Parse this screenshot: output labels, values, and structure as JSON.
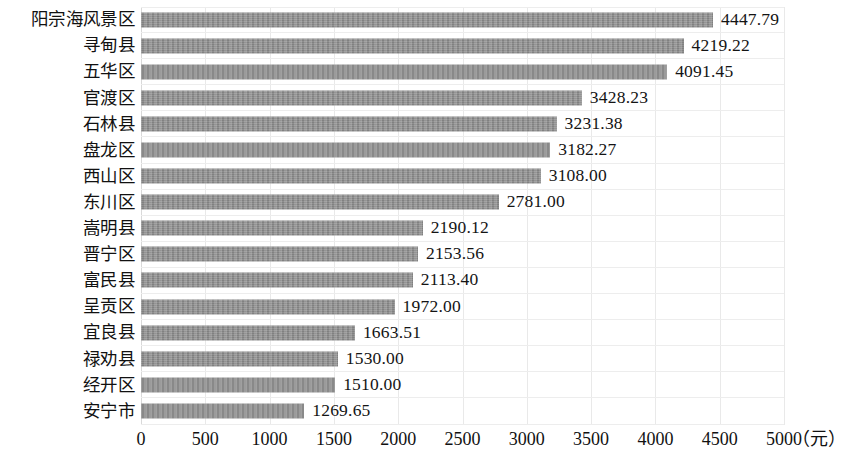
{
  "chart_data": {
    "type": "bar",
    "orientation": "horizontal",
    "title": "",
    "subtitle": "",
    "xlabel": "（元）",
    "ylabel": "",
    "categories": [
      "阳宗海风景区",
      "寻甸县",
      "五华区",
      "官渡区",
      "石林县",
      "盘龙区",
      "西山区",
      "东川区",
      "嵩明县",
      "晋宁区",
      "富民县",
      "呈贡区",
      "宜良县",
      "禄劝县",
      "经开区",
      "安宁市"
    ],
    "values": [
      4447.79,
      4219.22,
      4091.45,
      3428.23,
      3231.38,
      3182.27,
      3108.0,
      2781.0,
      2190.12,
      2153.56,
      2113.4,
      1972.0,
      1663.51,
      1530.0,
      1510.0,
      1269.65
    ],
    "value_labels": [
      "4447.79",
      "4219.22",
      "4091.45",
      "3428.23",
      "3231.38",
      "3182.27",
      "3108.00",
      "2781.00",
      "2190.12",
      "2153.56",
      "2113.40",
      "1972.00",
      "1663.51",
      "1530.00",
      "1510.00",
      "1269.65"
    ],
    "xlim": [
      0,
      5000
    ],
    "xticks": [
      0,
      500,
      1000,
      1500,
      2000,
      2500,
      3000,
      3500,
      4000,
      4500,
      5000
    ],
    "xtick_labels": [
      "0",
      "500",
      "1000",
      "1500",
      "2000",
      "2500",
      "3000",
      "3500",
      "4000",
      "4500",
      "5000"
    ],
    "grid": {
      "vertical": true,
      "horizontal": true
    },
    "legend": {
      "visible": false,
      "position": "none"
    },
    "colors": {
      "bar": "#8d8d8d",
      "grid": "#ededed",
      "text": "#111111",
      "background": "#ffffff"
    }
  }
}
